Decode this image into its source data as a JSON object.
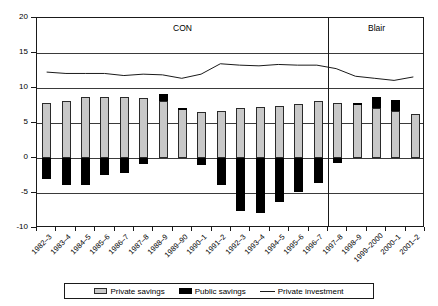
{
  "chart_data": {
    "type": "bar",
    "title": "",
    "subtitle": "",
    "xlabel": "",
    "ylabel": "",
    "ylim": [
      -10,
      20
    ],
    "yticks": [
      20,
      15,
      10,
      5,
      0,
      -5,
      -10
    ],
    "ytick_labels": [
      "20",
      "15",
      "10",
      "5",
      "0",
      "-5",
      "-10"
    ],
    "grid": true,
    "grid_axis": "y",
    "legend_position": "bottom",
    "stacked": true,
    "categories": [
      "1982–3",
      "1983–4",
      "1984–5",
      "1985–6",
      "1986–7",
      "1987–8",
      "1988–9",
      "1989–90",
      "1990–1",
      "1991–2",
      "1992–3",
      "1993–4",
      "1994–5",
      "1995–6",
      "1996–7",
      "1997–8",
      "1998–9",
      "1999–2000",
      "2000–1",
      "2001–2"
    ],
    "series": [
      {
        "name": "Private savings",
        "type": "bar",
        "color": "#c8c8c8",
        "values": [
          7.8,
          8.2,
          8.7,
          8.7,
          8.7,
          8.6,
          8.1,
          7.0,
          6.6,
          6.7,
          7.2,
          7.3,
          7.5,
          7.7,
          8.1,
          7.9,
          7.7,
          7.1,
          6.7,
          6.3
        ]
      },
      {
        "name": "Public savings",
        "type": "bar",
        "color": "#000000",
        "values": [
          -3.0,
          -3.8,
          -3.9,
          -2.4,
          -2.1,
          -0.9,
          1.1,
          0.2,
          -1.0,
          -3.8,
          -7.6,
          -7.8,
          -6.3,
          -4.8,
          -3.6,
          -0.7,
          0.2,
          1.6,
          1.6,
          0.0
        ]
      },
      {
        "name": "Private investment",
        "type": "line",
        "color": "#1a1a1a",
        "values": [
          12.2,
          12.0,
          12.0,
          12.0,
          11.7,
          11.9,
          11.8,
          11.3,
          11.9,
          13.4,
          13.2,
          13.1,
          13.3,
          13.2,
          13.2,
          12.7,
          11.6,
          11.3,
          11.0,
          11.5
        ]
      }
    ],
    "annotations": [
      {
        "text": "CON",
        "x_category_index": 7,
        "description": "Conservative government era label"
      },
      {
        "text": "Blair",
        "x_category_index": 17,
        "description": "Blair government era label"
      }
    ],
    "era_divider_after_category": "1996–7"
  },
  "legend": {
    "items": [
      {
        "label": "Private savings",
        "marker": "filled-box",
        "color": "#c8c8c8"
      },
      {
        "label": "Public savings",
        "marker": "filled-box",
        "color": "#000000"
      },
      {
        "label": "Private investment",
        "marker": "line",
        "color": "#1a1a1a"
      }
    ]
  }
}
